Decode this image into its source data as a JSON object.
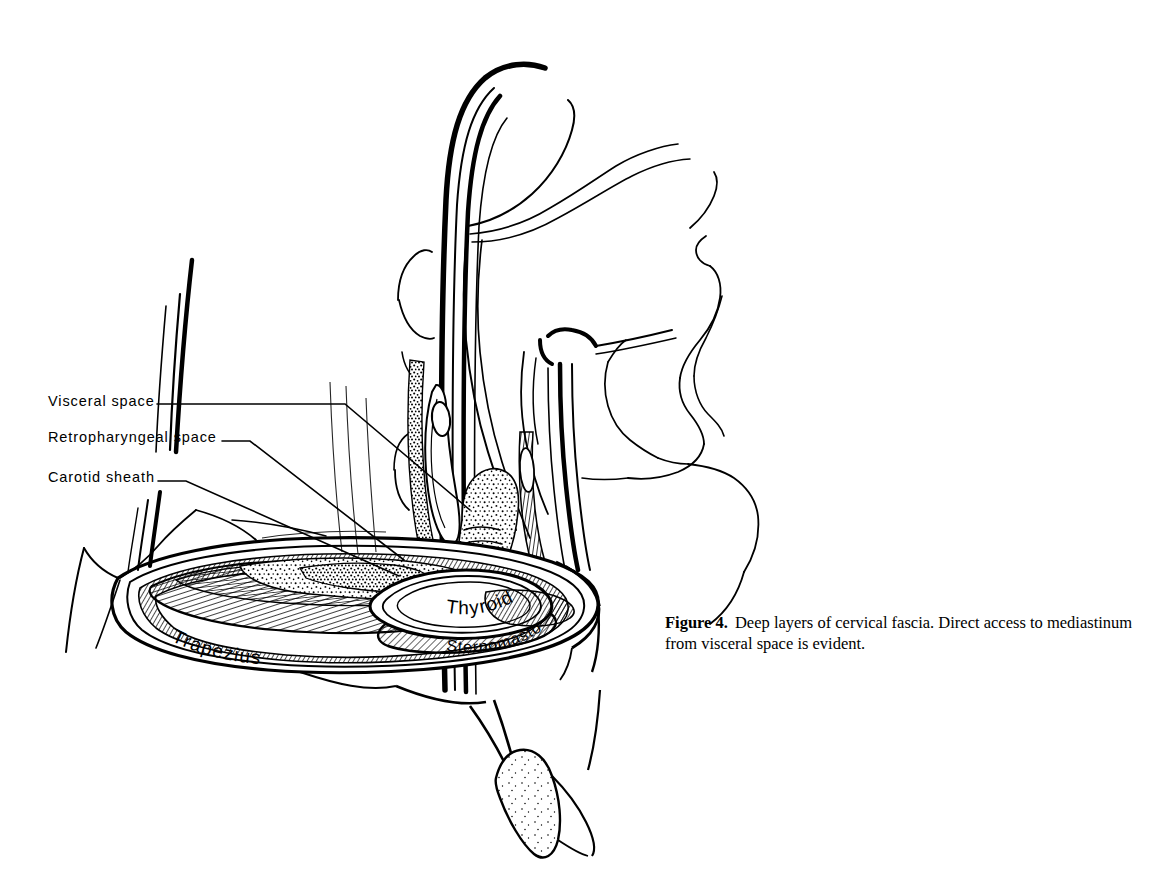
{
  "figure": {
    "caption_number": "Figure 4.",
    "caption_text": "Deep layers of cervical fascia. Direct access to mediastinum from visceral space is evident.",
    "background_color": "#ffffff",
    "ink_color": "#000000",
    "style": "pen-and-ink line engraving"
  },
  "leader_labels": [
    {
      "id": "visceral-space",
      "label": "Visceral space"
    },
    {
      "id": "retropharyngeal",
      "label": "Retropharyngeal space"
    },
    {
      "id": "carotid-sheath",
      "label": "Carotid sheath"
    }
  ],
  "structure_labels": [
    {
      "id": "trapezius",
      "label": "Trapezius"
    },
    {
      "id": "thyroid",
      "label": "Thyroid"
    },
    {
      "id": "sternomastoid",
      "label": "Sternomastoid"
    }
  ]
}
